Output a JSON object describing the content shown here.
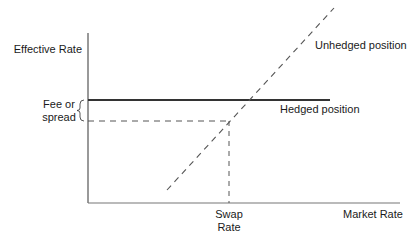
{
  "diagram": {
    "y_axis_label": "Effective Rate",
    "x_axis_label": "Market Rate",
    "fee_label_line1": "Fee or",
    "fee_label_line2": "spread",
    "swap_rate_line1": "Swap",
    "swap_rate_line2": "Rate",
    "unhedged_label": "Unhedged position",
    "hedged_label": "Hedged position",
    "colors": {
      "axis": "#555555",
      "hedged_line": "#333333",
      "dashed": "#555555",
      "text": "#1a1a1a"
    }
  }
}
